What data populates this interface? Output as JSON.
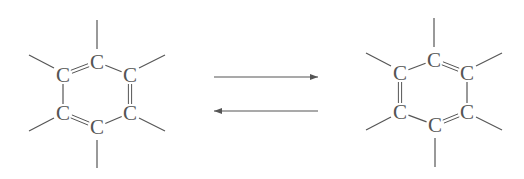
{
  "diagram": {
    "colors": {
      "line": "#555555",
      "text": "#555555",
      "background": "#ffffff"
    },
    "atom_label": "C",
    "molecules": [
      {
        "id": "left",
        "atoms": [
          {
            "label": "C",
            "x": 97,
            "y": 62
          },
          {
            "label": "C",
            "x": 130,
            "y": 75
          },
          {
            "label": "C",
            "x": 130,
            "y": 113
          },
          {
            "label": "C",
            "x": 97,
            "y": 127
          },
          {
            "label": "C",
            "x": 63,
            "y": 113
          },
          {
            "label": "C",
            "x": 63,
            "y": 75
          }
        ],
        "double_bonds": [
          [
            5,
            0
          ],
          [
            1,
            2
          ],
          [
            3,
            4
          ]
        ],
        "single_bonds": [
          [
            0,
            1
          ],
          [
            2,
            3
          ],
          [
            4,
            5
          ]
        ],
        "substituents": [
          {
            "from": 0,
            "x1": 97,
            "y1": 49,
            "x2": 97,
            "y2": 20
          },
          {
            "from": 1,
            "x1": 139,
            "y1": 68,
            "x2": 165,
            "y2": 55
          },
          {
            "from": 2,
            "x1": 139,
            "y1": 118,
            "x2": 165,
            "y2": 131
          },
          {
            "from": 3,
            "x1": 97,
            "y1": 140,
            "x2": 97,
            "y2": 168
          },
          {
            "from": 4,
            "x1": 54,
            "y1": 118,
            "x2": 29,
            "y2": 131
          },
          {
            "from": 5,
            "x1": 54,
            "y1": 68,
            "x2": 29,
            "y2": 55
          }
        ]
      },
      {
        "id": "right",
        "atoms": [
          {
            "label": "C",
            "x": 434,
            "y": 60
          },
          {
            "label": "C",
            "x": 467,
            "y": 73
          },
          {
            "label": "C",
            "x": 467,
            "y": 112
          },
          {
            "label": "C",
            "x": 435,
            "y": 125
          },
          {
            "label": "C",
            "x": 400,
            "y": 112
          },
          {
            "label": "C",
            "x": 400,
            "y": 73
          }
        ],
        "double_bonds": [
          [
            0,
            1
          ],
          [
            2,
            3
          ],
          [
            4,
            5
          ]
        ],
        "single_bonds": [
          [
            1,
            2
          ],
          [
            3,
            4
          ],
          [
            5,
            0
          ]
        ],
        "substituents": [
          {
            "from": 0,
            "x1": 434,
            "y1": 47,
            "x2": 434,
            "y2": 18
          },
          {
            "from": 1,
            "x1": 476,
            "y1": 66,
            "x2": 502,
            "y2": 53
          },
          {
            "from": 2,
            "x1": 476,
            "y1": 117,
            "x2": 502,
            "y2": 130
          },
          {
            "from": 3,
            "x1": 435,
            "y1": 138,
            "x2": 435,
            "y2": 167
          },
          {
            "from": 4,
            "x1": 391,
            "y1": 117,
            "x2": 366,
            "y2": 130
          },
          {
            "from": 5,
            "x1": 391,
            "y1": 66,
            "x2": 366,
            "y2": 53
          }
        ]
      }
    ],
    "arrows": [
      {
        "id": "forward-arrow",
        "direction": "right",
        "x1": 214,
        "x2": 318,
        "y": 77
      },
      {
        "id": "reverse-arrow",
        "direction": "left",
        "x1": 318,
        "x2": 214,
        "y": 111
      }
    ]
  }
}
